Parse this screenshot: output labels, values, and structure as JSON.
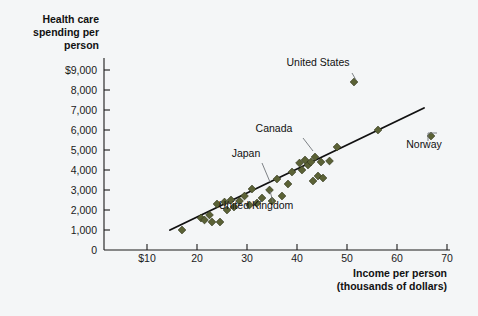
{
  "chart_data": {
    "type": "scatter",
    "title": "",
    "xlabel": "Income per person (thousands of dollars)",
    "xlabel_line1": "Income per person",
    "xlabel_line2": "(thousands of dollars)",
    "ylabel": "Health care spending per person",
    "ylabel_line1": "Health care",
    "ylabel_line2": "spending per",
    "ylabel_line3": "person",
    "xlim": [
      0,
      70
    ],
    "ylim": [
      0,
      9000
    ],
    "grid": false,
    "legend": "none",
    "xticks": [
      10,
      20,
      30,
      40,
      50,
      60,
      70
    ],
    "xtick_labels": [
      "$10",
      "20",
      "30",
      "40",
      "50",
      "60",
      "70"
    ],
    "yticks": [
      0,
      1000,
      2000,
      3000,
      4000,
      5000,
      6000,
      7000,
      8000,
      9000
    ],
    "ytick_labels": [
      "0",
      "1,000",
      "2,000",
      "3,000",
      "4,000",
      "5,000",
      "6,000",
      "7,000",
      "8,000",
      "$9,000"
    ],
    "marker_shape": "diamond",
    "marker_color": "#5b6236",
    "trend_line": {
      "x_start": 14.6,
      "y_start": 1000,
      "x_end": 65.4,
      "y_end": 7100,
      "color": "#111111"
    },
    "points": [
      {
        "x": 17.0,
        "y": 1000
      },
      {
        "x": 20.8,
        "y": 1600
      },
      {
        "x": 21.5,
        "y": 1500
      },
      {
        "x": 22.5,
        "y": 1750
      },
      {
        "x": 23.0,
        "y": 1400
      },
      {
        "x": 24.0,
        "y": 2300
      },
      {
        "x": 24.6,
        "y": 1400
      },
      {
        "x": 25.5,
        "y": 2400
      },
      {
        "x": 26.0,
        "y": 2000
      },
      {
        "x": 26.8,
        "y": 2500
      },
      {
        "x": 27.4,
        "y": 2150
      },
      {
        "x": 28.5,
        "y": 2450
      },
      {
        "x": 29.5,
        "y": 2700
      },
      {
        "x": 30.5,
        "y": 2250
      },
      {
        "x": 31.0,
        "y": 3050
      },
      {
        "x": 32.0,
        "y": 2350
      },
      {
        "x": 33.0,
        "y": 2600
      },
      {
        "x": 34.5,
        "y": 3000
      },
      {
        "x": 35.0,
        "y": 2450
      },
      {
        "x": 36.0,
        "y": 3550
      },
      {
        "x": 37.0,
        "y": 2700
      },
      {
        "x": 38.2,
        "y": 3300
      },
      {
        "x": 39.0,
        "y": 3900
      },
      {
        "x": 40.5,
        "y": 4350
      },
      {
        "x": 41.0,
        "y": 4000
      },
      {
        "x": 41.6,
        "y": 4500
      },
      {
        "x": 42.2,
        "y": 4250
      },
      {
        "x": 42.8,
        "y": 4400
      },
      {
        "x": 43.2,
        "y": 3450
      },
      {
        "x": 43.6,
        "y": 4650
      },
      {
        "x": 44.2,
        "y": 3700
      },
      {
        "x": 44.8,
        "y": 4400
      },
      {
        "x": 45.2,
        "y": 3600
      },
      {
        "x": 46.5,
        "y": 4450
      },
      {
        "x": 48.0,
        "y": 5150
      },
      {
        "x": 51.4,
        "y": 8400
      },
      {
        "x": 56.2,
        "y": 6000
      },
      {
        "x": 66.8,
        "y": 5700
      }
    ],
    "annotations": [
      {
        "label": "United States",
        "label_x": 318,
        "label_y": 66,
        "leader": [
          [
            352,
            73
          ],
          [
            356,
            80
          ]
        ],
        "point": {
          "x": 51.4,
          "y": 8400
        }
      },
      {
        "label": "Canada",
        "label_x": 274,
        "label_y": 132,
        "leader": [
          [
            303,
            138
          ],
          [
            313,
            151
          ]
        ],
        "point": {
          "x": 43.2,
          "y": 4650
        }
      },
      {
        "label": "Japan",
        "label_x": 246,
        "label_y": 157,
        "leader": [
          [
            262,
            163
          ],
          [
            270,
            182
          ]
        ],
        "point": {
          "x": 34.5,
          "y": 3000
        }
      },
      {
        "label": "United Kingdom",
        "label_x": 256,
        "label_y": 209,
        "leader": [
          [
            273,
            202
          ],
          [
            270,
            191
          ]
        ],
        "point": {
          "x": 35.0,
          "y": 2450
        }
      },
      {
        "label": "Norway",
        "label_x": 424,
        "label_y": 148,
        "leader": [
          [
            428,
            141
          ],
          [
            428,
            133
          ],
          [
            437,
            133
          ]
        ],
        "point": {
          "x": 66.8,
          "y": 5700
        }
      }
    ]
  },
  "axes": {
    "x_axis_name": "x-axis",
    "y_axis_name": "y-axis"
  }
}
